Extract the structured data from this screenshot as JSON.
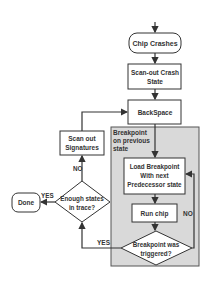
{
  "diagram": {
    "nodes": {
      "chip_crashes": "Chip Crashes",
      "scan_out_crash_state": [
        "Scan-out Crash",
        "State"
      ],
      "backspace": "BackSpace",
      "region_label": [
        "Breakpoint",
        "on previous",
        "state"
      ],
      "load_breakpoint": [
        "Load Breakpoint",
        "With next",
        "Predecessor state"
      ],
      "run_chip": "Run chip",
      "breakpoint_triggered": [
        "Breakpoint was",
        "triggered?"
      ],
      "scan_out_signatures": [
        "Scan out",
        "Signatures"
      ],
      "enough_states": [
        "Enough states",
        "in trace?"
      ],
      "done": "Done"
    },
    "edge_labels": {
      "enough_yes": "YES",
      "enough_no": "NO",
      "triggered_yes": "YES",
      "triggered_no": "NO"
    },
    "colors": {
      "region_fill": "#d9d9d9",
      "stroke": "#333333",
      "box_fill": "#ffffff"
    }
  }
}
